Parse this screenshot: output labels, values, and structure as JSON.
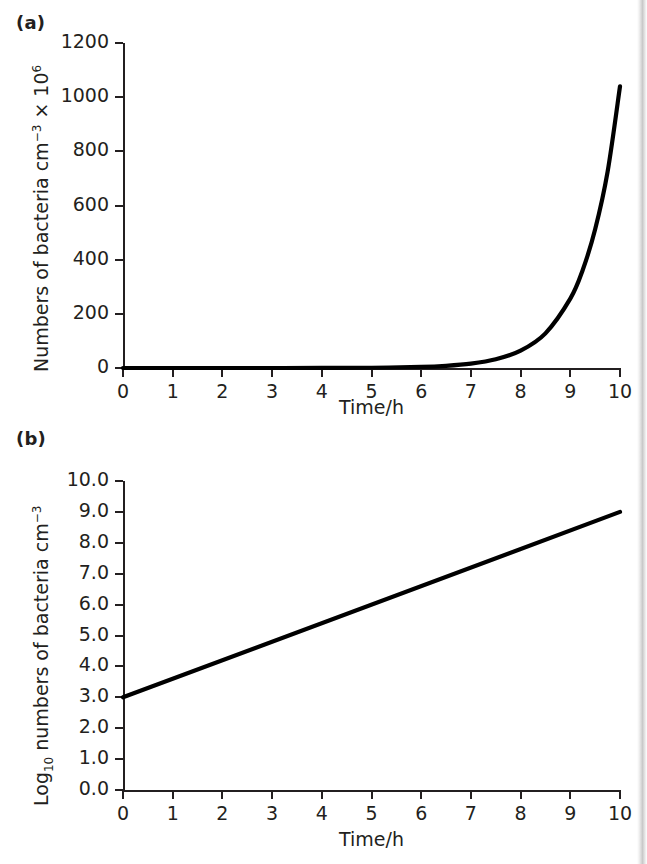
{
  "figure": {
    "panels": [
      {
        "label": "(a)",
        "ylabel_main": "Numbers of bacteria cm",
        "ylabel_sup1": "−3",
        "ylabel_mid": " × 10",
        "ylabel_sup2": "6",
        "xlabel": "Time/h"
      },
      {
        "label": "(b)",
        "ylabel_pre": "Log",
        "ylabel_sub": "10",
        "ylabel_main": " numbers of bacteria cm",
        "ylabel_sup1": "−3",
        "xlabel": "Time/h"
      }
    ]
  },
  "chart_data": [
    {
      "type": "line",
      "panel": "(a)",
      "title": "",
      "xlabel": "Time/h",
      "ylabel": "Numbers of bacteria cm−3 × 10⁶",
      "xlim": [
        0,
        10
      ],
      "ylim": [
        0,
        1200
      ],
      "xticks": [
        0,
        1,
        2,
        3,
        4,
        5,
        6,
        7,
        8,
        9,
        10
      ],
      "xtick_labels": [
        "0",
        "1",
        "2",
        "3",
        "4",
        "5",
        "6",
        "7",
        "8",
        "9",
        "10"
      ],
      "yticks": [
        0,
        200,
        400,
        600,
        800,
        1000,
        1200
      ],
      "ytick_labels": [
        "0",
        "200",
        "400",
        "600",
        "800",
        "1000",
        "1200"
      ],
      "grid": false,
      "legend": null,
      "series": [
        {
          "name": "Exponential bacterial growth (arithmetic scale)",
          "x": [
            0,
            1,
            2,
            3,
            4,
            5,
            6,
            6.5,
            7,
            7.5,
            8,
            8.5,
            9,
            9.25,
            9.5,
            9.75,
            10
          ],
          "y": [
            0.001,
            0.004,
            0.016,
            0.063,
            0.25,
            1.0,
            4.0,
            8.0,
            16.0,
            32.0,
            64.0,
            128.0,
            256.0,
            362.0,
            512.0,
            724.0,
            1040.0
          ]
        }
      ]
    },
    {
      "type": "line",
      "panel": "(b)",
      "title": "",
      "xlabel": "Time/h",
      "ylabel": "Log10 numbers of bacteria cm−3",
      "xlim": [
        0,
        10
      ],
      "ylim": [
        0.0,
        10.0
      ],
      "xticks": [
        0,
        1,
        2,
        3,
        4,
        5,
        6,
        7,
        8,
        9,
        10
      ],
      "xtick_labels": [
        "0",
        "1",
        "2",
        "3",
        "4",
        "5",
        "6",
        "7",
        "8",
        "9",
        "10"
      ],
      "yticks": [
        0.0,
        1.0,
        2.0,
        3.0,
        4.0,
        5.0,
        6.0,
        7.0,
        8.0,
        9.0,
        10.0
      ],
      "ytick_labels": [
        "0.0",
        "1.0",
        "2.0",
        "3.0",
        "4.0",
        "5.0",
        "6.0",
        "7.0",
        "8.0",
        "9.0",
        "10.0"
      ],
      "grid": false,
      "legend": null,
      "series": [
        {
          "name": "Exponential bacterial growth (log10 scale)",
          "x": [
            0,
            10
          ],
          "y": [
            3.0,
            9.0
          ]
        }
      ]
    }
  ],
  "style": {
    "line_color": "#000000",
    "axis_color": "#231f20",
    "background": "#ffffff"
  }
}
